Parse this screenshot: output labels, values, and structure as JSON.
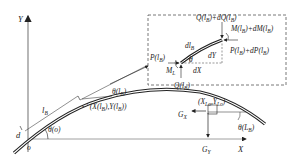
{
  "diagram": {
    "type": "structural-mechanics-free-body",
    "axes": {
      "x_label": "X",
      "y_label": "Y",
      "origin_label": "o"
    },
    "main_curve_labels": {
      "diameter": "d",
      "arc_length": "l",
      "arc_length_sub": "B",
      "theta_origin": "θ(o)",
      "theta_lb": "θ(l",
      "theta_lb_sub": "B",
      "theta_lb_close": ")",
      "point_coords": "(X(l",
      "point_coords_mid": "),Y(l",
      "point_coords_end": "))",
      "point_sub": "B",
      "end_coords": "(X",
      "end_coords_mid": ",Y",
      "end_coords_end": ")",
      "end_sub": "Lo",
      "end_theta": "θ(L",
      "end_theta_sub": "B",
      "end_theta_close": ")",
      "gx": "G",
      "gx_sub": "X",
      "gy": "G",
      "gy_sub": "Y"
    },
    "inset": {
      "element_length": "dl",
      "element_length_sub": "B",
      "dx": "dX",
      "dy": "dY",
      "theta": "θ",
      "shear_top": "Q(l",
      "shear_top_sub": "B",
      "shear_top_plus": ")+dQ(l",
      "shear_top_end": ")",
      "moment_top": "M(l",
      "moment_top_plus": ")+dM(l",
      "moment_top_end": ")",
      "axial_right": "P(l",
      "axial_right_plus": ")+dP(l",
      "axial_right_end": ")",
      "axial_left": "P(l",
      "axial_left_end": ")",
      "moment_left": "M",
      "moment_left_sub": "L",
      "shear_bottom": "Q(l",
      "shear_bottom_end": ")"
    },
    "colors": {
      "line": "#222222",
      "axis": "#888888",
      "dash": "#555555"
    }
  }
}
